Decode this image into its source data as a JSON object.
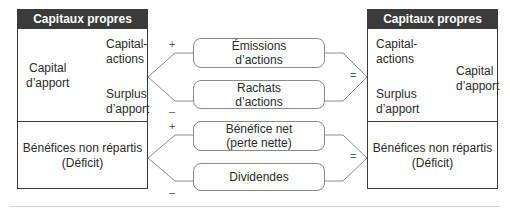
{
  "left_box": {
    "header": "Capitaux propres",
    "capital_apport": "Capital\nd’apport",
    "capital_actions": "Capital-\nactions",
    "surplus_apport": "Surplus\nd’apport",
    "benefices": "Bénéfices non répartis\n(Déficit)"
  },
  "right_box": {
    "header": "Capitaux propres",
    "capital_actions": "Capital-\nactions",
    "surplus_apport": "Surplus\nd’apport",
    "capital_apport": "Capital\nd’apport",
    "benefices": "Bénéfices non répartis\n(Déficit)"
  },
  "top_flow": {
    "plus_sign": "+",
    "minus_sign": "–",
    "equals_sign": "=",
    "increase": "Émissions\nd’actions",
    "decrease": "Rachats\nd’actions"
  },
  "bottom_flow": {
    "plus_sign": "+",
    "minus_sign": "–",
    "equals_sign": "=",
    "increase": "Bénéfice net\n(perte nette)",
    "decrease": "Dividendes"
  },
  "colors": {
    "header_bg": "#3b3b3b",
    "header_text": "#ffffff",
    "border": "#3a3a3a",
    "connector": "#8a8a8a"
  }
}
